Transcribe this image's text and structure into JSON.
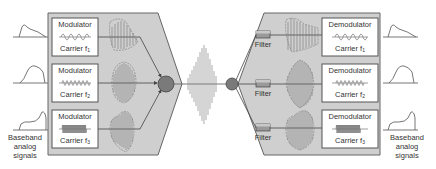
{
  "colors": {
    "panel_fill": "#cfcfcf",
    "panel_stroke": "#666666",
    "box_fill": "#ffffff",
    "box_stroke": "#555555",
    "signal_stroke": "#666666",
    "node_fill": "#7a7a7a",
    "filter_fill": "#9a9a9a"
  },
  "transmitter": {
    "input_label": [
      "Baseband",
      "analog",
      "signals"
    ],
    "modulators": [
      {
        "label": "Modulator",
        "carrier_text": "Carrier f",
        "carrier_sub": "1"
      },
      {
        "label": "Modulator",
        "carrier_text": "Carrier f",
        "carrier_sub": "2"
      },
      {
        "label": "Modulator",
        "carrier_text": "Carrier f",
        "carrier_sub": "3"
      }
    ]
  },
  "receiver": {
    "output_label": [
      "Baseband",
      "analog",
      "signals"
    ],
    "filters": [
      {
        "label": "Filter"
      },
      {
        "label": "Filter"
      },
      {
        "label": "Filter"
      }
    ],
    "demodulators": [
      {
        "label": "Demodulator",
        "carrier_text": "Carrier f",
        "carrier_sub": "1"
      },
      {
        "label": "Demodulator",
        "carrier_text": "Carrier f",
        "carrier_sub": "2"
      },
      {
        "label": "Demodulator",
        "carrier_text": "Carrier f",
        "carrier_sub": "3"
      }
    ]
  }
}
